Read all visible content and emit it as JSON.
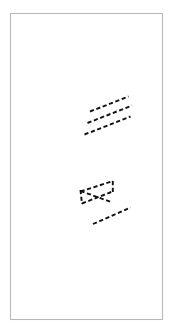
{
  "figure": {
    "title": "",
    "width": 185,
    "height": 335,
    "background_color": "#ffffff",
    "border": {
      "name": "figure-border",
      "x": 10.5,
      "y": 13.5,
      "width": 152,
      "height": 306,
      "stroke_color": "#b8b8b8",
      "stroke_width": 1.1,
      "fill": "none"
    },
    "stroke_color": "#111111",
    "stroke_width": 1.9,
    "dash_pattern": "4.2 2.6",
    "groups": [
      {
        "name": "upper-parallel-lines",
        "label": "three parallel dashed diagonal lines",
        "segments": [
          {
            "name": "upper-line-1",
            "x1": 90.0,
            "y1": 111.5,
            "x2": 128.5,
            "y2": 96.5
          },
          {
            "name": "upper-line-2",
            "x1": 87.5,
            "y1": 123.0,
            "x2": 132.0,
            "y2": 105.5
          },
          {
            "name": "upper-line-3",
            "x1": 84.5,
            "y1": 134.5,
            "x2": 130.5,
            "y2": 116.5
          }
        ]
      },
      {
        "name": "lower-bowtie",
        "label": "crossing X shape with vertical end caps",
        "segments": [
          {
            "name": "bowtie-diagonal-down",
            "x1": 80.5,
            "y1": 191.5,
            "x2": 113.0,
            "y2": 181.0
          },
          {
            "name": "bowtie-diagonal-up",
            "x1": 80.5,
            "y1": 191.0,
            "x2": 112.5,
            "y2": 202.5
          },
          {
            "name": "bowtie-lower-chord",
            "x1": 82.0,
            "y1": 203.5,
            "x2": 112.5,
            "y2": 191.5
          },
          {
            "name": "bowtie-cap-left",
            "x1": 80.5,
            "y1": 190.0,
            "x2": 82.0,
            "y2": 204.0
          },
          {
            "name": "bowtie-cap-right",
            "x1": 112.8,
            "y1": 181.0,
            "x2": 112.8,
            "y2": 193.0
          }
        ]
      },
      {
        "name": "bottom-line",
        "label": "single dashed diagonal line",
        "segments": [
          {
            "name": "bottom-line-1",
            "x1": 93.0,
            "y1": 224.0,
            "x2": 130.5,
            "y2": 207.5
          }
        ]
      }
    ]
  }
}
